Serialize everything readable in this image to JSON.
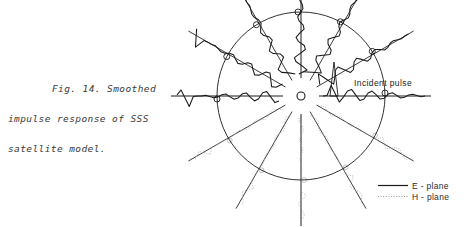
{
  "figure": {
    "caption_line1": "Fig. 14.  Smoothed",
    "caption_line2": "impulse response of SSS",
    "caption_line3": "satellite model.",
    "annotation_incident": "Incident pulse",
    "background_color": "#ffffff",
    "ink_color": "#1a1a1a",
    "h_plane_color": "#a8a8a8"
  },
  "legend": {
    "items": [
      {
        "label": "E - plane",
        "style": "solid",
        "color": "#1a1a1a"
      },
      {
        "label": "H - plane",
        "style": "dotted",
        "color": "#9a9a9a"
      }
    ]
  },
  "chart_data": {
    "type": "line",
    "title": "Smoothed impulse response of SSS satellite model",
    "subtitle": "",
    "xlabel": "",
    "ylabel": "",
    "plot_style": "polar-radial-waveform",
    "grid": false,
    "legend_position": "bottom-right",
    "center": {
      "x": 301,
      "y": 96
    },
    "radius": 84,
    "hub_radius": 4,
    "spoke_inner_gap": 18,
    "spoke_outer_overshoot": 46,
    "angles_deg": [
      0,
      30,
      60,
      90,
      120,
      150,
      180,
      210,
      240,
      270,
      300,
      330
    ],
    "series": [
      {
        "name": "E - plane",
        "style": "solid",
        "color": "#1a1a1a",
        "angles_deg": [
          0,
          30,
          60,
          90,
          120,
          150,
          180
        ],
        "description": "Upper hemisphere radial impulse responses, solid dark traces with ringing tails"
      },
      {
        "name": "H - plane",
        "style": "dotted",
        "color": "#a8a8a8",
        "angles_deg": [
          180,
          210,
          240,
          270,
          300,
          330,
          0
        ],
        "description": "Lower hemisphere radial impulse responses, faint dotted traces of smaller amplitude"
      }
    ],
    "waveform_samples": {
      "t": [
        0.0,
        0.04,
        0.08,
        0.12,
        0.16,
        0.2,
        0.24,
        0.28,
        0.32,
        0.36,
        0.4,
        0.44,
        0.48,
        0.52,
        0.56,
        0.6,
        0.64,
        0.68,
        0.72,
        0.76,
        0.8,
        0.84,
        0.88,
        0.92,
        0.96,
        1.0
      ],
      "amplitude": [
        0.0,
        0.05,
        0.95,
        0.2,
        -0.55,
        -0.1,
        0.45,
        0.6,
        0.1,
        -0.4,
        -0.3,
        0.25,
        0.45,
        0.12,
        -0.28,
        -0.2,
        0.18,
        0.3,
        0.08,
        -0.18,
        -0.12,
        0.1,
        0.16,
        0.04,
        -0.06,
        0.0
      ],
      "note": "Normalized smoothed impulse response; leading spike is the incident pulse"
    },
    "annotations": [
      {
        "text": "Incident pulse",
        "at_angle_deg": 0,
        "x": 354,
        "y": 86
      }
    ]
  }
}
